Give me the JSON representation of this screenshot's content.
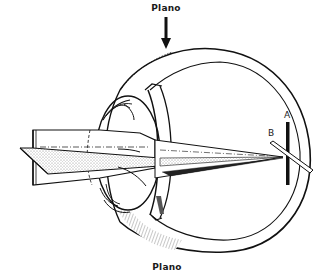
{
  "diagram": {
    "labels": {
      "top_axis": "Plano",
      "bottom_axis": "Plano",
      "point_a": "A",
      "point_b": "B"
    },
    "arrow": {
      "direction": "down",
      "meaning": "plano meridian indicator"
    },
    "colors": {
      "ink": "#111111",
      "paper": "#ffffff",
      "stipple": "#9a9a9a"
    },
    "elements": [
      "eyeball-globe (sectioned)",
      "cornea/ciliary ring",
      "incident light beam (rectangular prism)",
      "horizontal plane sheet",
      "converging ray cone",
      "retina line image A",
      "focal line B"
    ]
  }
}
